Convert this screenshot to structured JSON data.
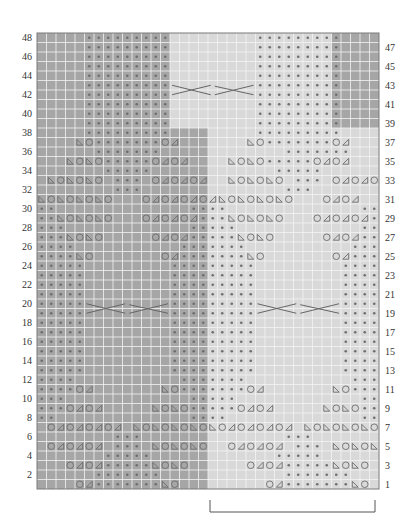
{
  "chart_data": {
    "type": "knitting-chart",
    "title": "",
    "columns": 36,
    "rows": 48,
    "left_row_labels": [
      2,
      4,
      6,
      8,
      10,
      12,
      14,
      16,
      18,
      20,
      22,
      24,
      26,
      28,
      30,
      32,
      34,
      36,
      38,
      40,
      42,
      44,
      46,
      48
    ],
    "right_row_labels": [
      1,
      3,
      5,
      7,
      9,
      11,
      13,
      15,
      17,
      19,
      21,
      23,
      25,
      27,
      29,
      31,
      33,
      35,
      37,
      39,
      41,
      43,
      45,
      47
    ],
    "colors": {
      "dark_shade": "#a6a6a6",
      "light_shade": "#d9d9d9",
      "grid_line": "#f4f4f4",
      "symbol": "#6e6e6e",
      "frame": "#7a7a7a"
    },
    "legend_symbols": {
      "*": "purl-dot",
      "o": "yarn-over-circle",
      "l": "ssk-left-triangle",
      "r": "k2tog-right-triangle",
      ".": "knit-empty"
    },
    "shading": [
      {
        "rows": [
          39,
          48
        ],
        "dark_cols": [
          [
            0,
            13
          ],
          [
            31,
            35
          ]
        ]
      },
      {
        "rows": [
          1,
          38
        ],
        "dark_cols": [
          [
            0,
            17
          ]
        ]
      }
    ],
    "pattern_rows": {
      "48": ".....*********.........*********.....",
      "47": ".....*********.........*********.....",
      "46": ".....*********.........*********.....",
      "45": ".....*********.........*********.....",
      "44": ".....*********.........*********.....",
      "43": ".....*********.........*********.....",
      "42": ".....*********.........*********.....",
      "41": ".....*********.........*********.....",
      "40": ".....*********.........*********.....",
      "39": ".....*********.........*********.....",
      "38": ".....*********.........*********.....",
      "37": "....lo*******or.......lo*******or...",
      "36": "......*******.............*******.....",
      "35": "...lolo*****oror....lolo*****oror...",
      "34": ".......*****.............*****......",
      "33": ".lololo.***.ororor..lololo.***.ororor",
      "32": "........***...............***.......",
      "31": "lolololo...ororororlolololo...oror...",
      "30": "**..............****..............**",
      "29": "**lololo...ororor***lololo...ororor*",
      "28": "***.............*****.............**",
      "27": "***lolo.....oror*****lolo.....oror**",
      "26": "****...........*******...........***",
      "25": "****lo.......or*******lo.......or***",
      "24": "*****.........*********.........****",
      "23": "*****.........*********.........****",
      "22": "*****.........*********.........****",
      "21": "*****.........*********.........****",
      "20": "*****.........*********.........****",
      "19": "*****.........*********.........****",
      "18": "*****.........*********.........****",
      "17": "*****.........*********.........****",
      "16": "*****.........*********.........****",
      "15": "*****.........*********.........****",
      "14": "*****.........*********.........****",
      "13": "*****.........*********.........****",
      "12": "****...........*******...........***",
      "11": "****or.......lo*******or.......lo***",
      "10": "***.............*****.............**",
      "9": "***oror.....lolo*****oror.....lolo**",
      "8": "**..............****..............**",
      "7": ".orororor.lololololorororor.lolololo.",
      "6": "........***...............***.......",
      "5": ".ororor.***.lololo..ororor.***.lololo",
      "4": ".......*****.............*****......",
      "3": "...oror*****lolo......oror*****lolo..",
      "2": "......*******.............*******....",
      "1": "....or*******lo.........or*******lo.."
    },
    "cables": [
      {
        "rows": [
          42,
          43
        ],
        "cols": [
          14,
          22
        ]
      },
      {
        "rows": [
          19,
          20
        ],
        "cols": [
          5,
          13
        ]
      },
      {
        "rows": [
          19,
          20
        ],
        "cols": [
          23,
          31
        ]
      }
    ],
    "bracket": {
      "cols": [
        18,
        35
      ],
      "label": ""
    }
  }
}
